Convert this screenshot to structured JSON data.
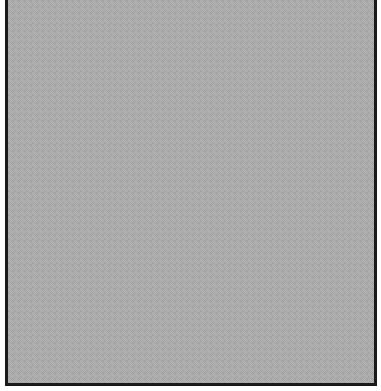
{
  "canvas": {
    "width": 381,
    "height": 391,
    "background_color": "#ffffff"
  },
  "panel": {
    "fill_color": "#a9a9a9",
    "border_color": "#1a1a1a",
    "pattern": "gray-checkerboard-dither"
  }
}
